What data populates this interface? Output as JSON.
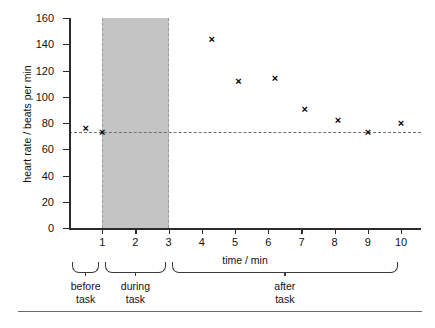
{
  "chart_data": {
    "type": "scatter",
    "title": "",
    "xlabel": "time / min",
    "ylabel": "heart rate / beats per min",
    "xlim": [
      0,
      10.6
    ],
    "ylim": [
      0,
      160
    ],
    "grid": false,
    "legend": null,
    "x_ticks": [
      1,
      2,
      3,
      4,
      5,
      6,
      7,
      8,
      9,
      10
    ],
    "y_ticks": [
      0,
      20,
      40,
      60,
      80,
      100,
      120,
      140,
      160
    ],
    "x": [
      0.5,
      1.0,
      4.3,
      5.1,
      6.2,
      7.1,
      8.1,
      9.0,
      10.0
    ],
    "values": [
      76,
      73,
      144,
      112,
      114,
      90,
      82,
      73,
      80
    ],
    "points": [
      {
        "x": 0.5,
        "y": 76
      },
      {
        "x": 1.0,
        "y": 73
      },
      {
        "x": 4.3,
        "y": 144
      },
      {
        "x": 5.1,
        "y": 112
      },
      {
        "x": 6.2,
        "y": 114
      },
      {
        "x": 7.1,
        "y": 90
      },
      {
        "x": 8.1,
        "y": 82
      },
      {
        "x": 9.0,
        "y": 73
      },
      {
        "x": 10.0,
        "y": 80
      }
    ],
    "marker": "x",
    "marker_color": "#000000",
    "annotations": [
      {
        "name": "resting-baseline",
        "type": "hline",
        "y": 73,
        "style": "dashed",
        "color": "#6e6e6e"
      },
      {
        "name": "during-task-band",
        "type": "vspan",
        "x0": 1,
        "x1": 3,
        "color": "#c4c4c4",
        "edge_style": "dashed"
      }
    ],
    "phases": [
      {
        "label_line1": "before",
        "label_line2": "task",
        "x0": 0.0,
        "x1": 1.0
      },
      {
        "label_line1": "during",
        "label_line2": "task",
        "x0": 1.0,
        "x1": 3.0
      },
      {
        "label_line1": "after",
        "label_line2": "task",
        "x0": 3.0,
        "x1": 10.0
      }
    ]
  }
}
